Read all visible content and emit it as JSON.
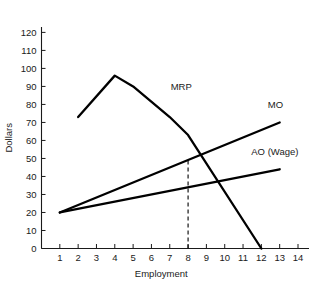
{
  "chart_data": {
    "type": "line",
    "title": "",
    "xlabel": "Employment",
    "ylabel": "Dollars",
    "xlim": [
      0,
      14.6
    ],
    "ylim": [
      0,
      123
    ],
    "grid": false,
    "legend_position": "inline-right",
    "x_ticks": [
      1,
      2,
      3,
      4,
      5,
      6,
      7,
      8,
      9,
      10,
      11,
      12,
      13,
      14
    ],
    "y_ticks": [
      0,
      10,
      20,
      30,
      40,
      50,
      60,
      70,
      80,
      90,
      100,
      110,
      120
    ],
    "series": [
      {
        "name": "MRP",
        "label": "MRP",
        "label_x": 7.05,
        "label_y": 88,
        "x": [
          2,
          4,
          5,
          7,
          8,
          12
        ],
        "values": [
          73,
          96,
          90,
          73,
          63,
          0
        ]
      },
      {
        "name": "MO",
        "label": "MO",
        "label_x": 12.35,
        "label_y": 78,
        "x": [
          1,
          13
        ],
        "values": [
          20,
          70
        ]
      },
      {
        "name": "AO (Wage)",
        "label": "AO (Wage)",
        "label_x": 11.45,
        "label_y": 52,
        "x": [
          1,
          13
        ],
        "values": [
          20,
          44
        ]
      }
    ],
    "annotations": [
      {
        "name": "equilibrium-guideline",
        "type": "vertical-dashed",
        "x": 8,
        "y_from": 0,
        "y_to": 50
      }
    ]
  }
}
